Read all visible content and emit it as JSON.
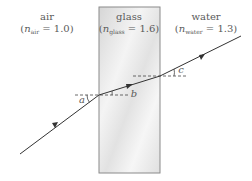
{
  "media": [
    {
      "name": "air",
      "label": "air",
      "n_symbol": "n",
      "n_sub": "air",
      "n_value": "1.0"
    },
    {
      "name": "glass",
      "label": "glass",
      "n_symbol": "n",
      "n_sub": "glass",
      "n_value": "1.6"
    },
    {
      "name": "water",
      "label": "water",
      "n_symbol": "n",
      "n_sub": "water",
      "n_value": "1.3"
    }
  ],
  "angles": {
    "a": "a",
    "b": "b",
    "c": "c"
  },
  "colors": {
    "ray": "#333333",
    "glass_border": "#8a8a8a",
    "dashed_normal": "#444444",
    "text": "#5a5a5a"
  }
}
